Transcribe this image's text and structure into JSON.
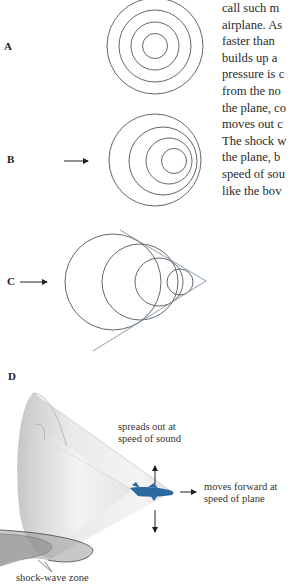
{
  "body_text": {
    "lines": [
      "call such m",
      "airplane. As",
      "faster than",
      "builds up a",
      "pressure is c",
      "from the no",
      "the plane, co",
      "moves out c",
      "The shock w",
      "the plane, b",
      "speed of sou",
      "like the bov"
    ]
  },
  "panels": {
    "a": {
      "label": "A"
    },
    "b": {
      "label": "B"
    },
    "c": {
      "label": "C"
    },
    "d": {
      "label": "D",
      "annotation_up": [
        "spreads out at",
        "speed of sound"
      ],
      "annotation_forward": [
        "moves forward at",
        "speed of plane"
      ],
      "annotation_bottom": "shock-wave zone"
    }
  },
  "colors": {
    "line": "#555555",
    "tangent": "#6f8fb0",
    "plane": "#2a6a9e",
    "cone": "#c8c8c8"
  }
}
